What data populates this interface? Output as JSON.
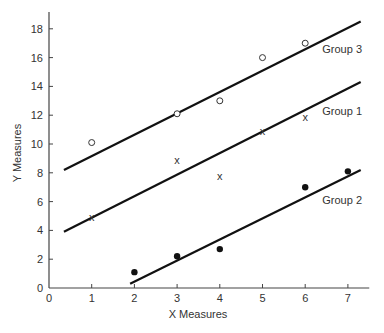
{
  "chart_data": {
    "type": "scatter",
    "title": "",
    "xlabel": "X Measures",
    "ylabel": "Y Measures",
    "xlim": [
      0,
      7.5
    ],
    "ylim": [
      0,
      19
    ],
    "xticks": [
      0,
      1,
      2,
      3,
      4,
      5,
      6,
      7
    ],
    "yticks": [
      0,
      2,
      4,
      6,
      8,
      10,
      12,
      14,
      16,
      18
    ],
    "grid": false,
    "legend": "inline labels at right end of regression lines",
    "series": [
      {
        "name": "Group 3",
        "marker": "open-circle",
        "points": [
          [
            1,
            10.1
          ],
          [
            3,
            12.1
          ],
          [
            4,
            13.0
          ],
          [
            5,
            16.0
          ],
          [
            6,
            17.0
          ]
        ],
        "line": [
          [
            0.35,
            8.2
          ],
          [
            7.3,
            18.5
          ]
        ],
        "label_pos": [
          6.4,
          16.3
        ]
      },
      {
        "name": "Group 1",
        "marker": "x",
        "points": [
          [
            1,
            4.9
          ],
          [
            3,
            8.9
          ],
          [
            4,
            7.8
          ],
          [
            5,
            10.9
          ],
          [
            6,
            11.9
          ]
        ],
        "line": [
          [
            0.35,
            3.9
          ],
          [
            7.3,
            14.3
          ]
        ],
        "label_pos": [
          6.4,
          12.0
        ]
      },
      {
        "name": "Group 2",
        "marker": "filled-circle",
        "points": [
          [
            2,
            1.1
          ],
          [
            3,
            2.2
          ],
          [
            4,
            2.7
          ],
          [
            6,
            7.0
          ],
          [
            7,
            8.1
          ]
        ],
        "line": [
          [
            1.9,
            0.3
          ],
          [
            7.3,
            8.2
          ]
        ],
        "label_pos": [
          6.4,
          5.8
        ]
      }
    ]
  }
}
